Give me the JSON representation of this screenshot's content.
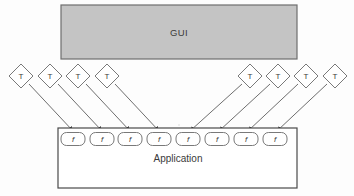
{
  "diagram": {
    "gui_box": {
      "label": "GUI",
      "x": 61,
      "y": 5,
      "width": 236,
      "height": 54,
      "fill": "#c4c4c4",
      "stroke": "#6e6e6e"
    },
    "application_box": {
      "label": "Application",
      "x": 58,
      "y": 128,
      "width": 239,
      "height": 60,
      "fill": "#ffffff",
      "stroke": "#4a4a4a",
      "label_x": 178,
      "label_y": 162
    },
    "test_nodes": [
      {
        "label": "T",
        "cx": 21,
        "cy": 76,
        "rx": 12,
        "ry": 12
      },
      {
        "label": "T",
        "cx": 50,
        "cy": 76,
        "rx": 12,
        "ry": 12
      },
      {
        "label": "T",
        "cx": 78,
        "cy": 76,
        "rx": 12,
        "ry": 12
      },
      {
        "label": "T",
        "cx": 107,
        "cy": 76,
        "rx": 12,
        "ry": 12
      },
      {
        "label": "T",
        "cx": 250,
        "cy": 76,
        "rx": 12,
        "ry": 12
      },
      {
        "label": "T",
        "cx": 278,
        "cy": 76,
        "rx": 12,
        "ry": 12
      },
      {
        "label": "T",
        "cx": 306,
        "cy": 76,
        "rx": 12,
        "ry": 12
      },
      {
        "label": "T",
        "cx": 335,
        "cy": 76,
        "rx": 12,
        "ry": 12
      }
    ],
    "function_nodes": [
      {
        "label": "f",
        "cx": 73,
        "cy": 139,
        "width": 24,
        "height": 13
      },
      {
        "label": "f",
        "cx": 102,
        "cy": 139,
        "width": 24,
        "height": 13
      },
      {
        "label": "f",
        "cx": 130,
        "cy": 139,
        "width": 24,
        "height": 13
      },
      {
        "label": "f",
        "cx": 159,
        "cy": 139,
        "width": 24,
        "height": 13
      },
      {
        "label": "f",
        "cx": 188,
        "cy": 139,
        "width": 24,
        "height": 13
      },
      {
        "label": "f",
        "cx": 217,
        "cy": 139,
        "width": 24,
        "height": 13
      },
      {
        "label": "f",
        "cx": 246,
        "cy": 139,
        "width": 24,
        "height": 13
      },
      {
        "label": "f",
        "cx": 275,
        "cy": 139,
        "width": 24,
        "height": 13
      }
    ],
    "arrows": [
      {
        "from": 0,
        "to": 0,
        "x1": 29,
        "y1": 84,
        "x2": 73,
        "y2": 131
      },
      {
        "from": 1,
        "to": 1,
        "x1": 58,
        "y1": 84,
        "x2": 102,
        "y2": 131
      },
      {
        "from": 2,
        "to": 2,
        "x1": 86,
        "y1": 84,
        "x2": 130,
        "y2": 131
      },
      {
        "from": 3,
        "to": 3,
        "x1": 115,
        "y1": 84,
        "x2": 159,
        "y2": 131
      },
      {
        "from": 4,
        "to": 4,
        "x1": 242,
        "y1": 84,
        "x2": 190,
        "y2": 131
      },
      {
        "from": 5,
        "to": 5,
        "x1": 270,
        "y1": 84,
        "x2": 219,
        "y2": 131
      },
      {
        "from": 6,
        "to": 6,
        "x1": 298,
        "y1": 84,
        "x2": 248,
        "y2": 131
      },
      {
        "from": 7,
        "to": 7,
        "x1": 327,
        "y1": 84,
        "x2": 277,
        "y2": 131
      }
    ],
    "stroke_color": "#5d5d5d",
    "node_stroke": "#6a6a6a",
    "node_fill": "#ffffff"
  }
}
